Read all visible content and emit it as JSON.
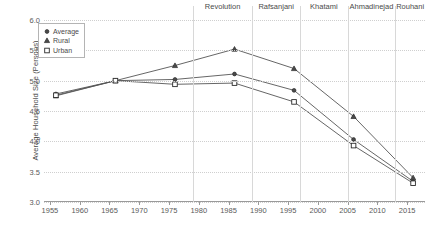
{
  "chart_data": {
    "type": "line",
    "title": "",
    "xlabel": "",
    "ylabel": "Average Household Size (Persons)",
    "xlim": [
      1954,
      2018
    ],
    "ylim": [
      3.0,
      6.0
    ],
    "grid": true,
    "legend_position": "top-left",
    "x": [
      1956,
      1966,
      1976,
      1986,
      1996,
      2006,
      2016
    ],
    "xticks": [
      1955,
      1960,
      1965,
      1970,
      1975,
      1980,
      1985,
      1990,
      1995,
      2000,
      2005,
      2010,
      2015
    ],
    "yticks": [
      3.0,
      3.5,
      4.0,
      4.5,
      5.0,
      5.5,
      6.0
    ],
    "ytick_labels": [
      "3.0",
      "3.5",
      "4.0",
      "4.5",
      "5.0",
      "5.5",
      "6.0"
    ],
    "xtick_labels": [
      "1955",
      "1960",
      "1965",
      "1970",
      "1975",
      "1980",
      "1985",
      "1990",
      "1995",
      "2000",
      "2005",
      "2010",
      "2015"
    ],
    "series": [
      {
        "name": "Average",
        "marker": "circle",
        "values": [
          4.78,
          5.0,
          5.02,
          5.11,
          4.84,
          4.03,
          3.34
        ]
      },
      {
        "name": "Rural",
        "marker": "triangle",
        "values": [
          4.75,
          5.0,
          5.25,
          5.52,
          5.2,
          4.41,
          3.4
        ]
      },
      {
        "name": "Urban",
        "marker": "square",
        "values": [
          4.76,
          5.0,
          4.94,
          4.96,
          4.65,
          3.93,
          3.31
        ]
      }
    ],
    "annotations": [
      {
        "label": "Revolution",
        "x": 1979
      },
      {
        "label": "Rafsanjani",
        "x": 1989
      },
      {
        "label": "Khatami",
        "x": 1997
      },
      {
        "label": "Ahmadinejad",
        "x": 2005
      },
      {
        "label": "Rouhani",
        "x": 2013
      }
    ],
    "colors": {
      "line": "#555555",
      "marker": "#2b2b2b",
      "grid": "#cfcfcf",
      "axis": "#9a9a9a",
      "divider": "#d8d8d8",
      "text": "#4a4a4a",
      "background": "#ffffff"
    }
  }
}
